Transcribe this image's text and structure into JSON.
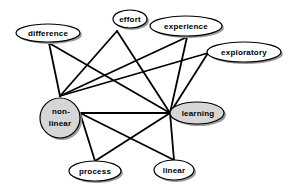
{
  "diagram": {
    "colors": {
      "plain_node_fill": "#ffffff",
      "highlight_node_fill": "#d6d6d6",
      "stroke": "#000000",
      "shadow": "#9a9a9a"
    },
    "nodes": [
      {
        "id": "difference",
        "label": "difference",
        "highlight": false
      },
      {
        "id": "effort",
        "label": "effort",
        "highlight": false
      },
      {
        "id": "experience",
        "label": "experience",
        "highlight": false
      },
      {
        "id": "exploratory",
        "label": "exploratory",
        "highlight": false
      },
      {
        "id": "non-linear",
        "label_line1": "non-",
        "label_line2": "linear",
        "highlight": true
      },
      {
        "id": "learning",
        "label": "learning",
        "highlight": true
      },
      {
        "id": "process",
        "label": "process",
        "highlight": false
      },
      {
        "id": "linear",
        "label": "linear",
        "highlight": false
      }
    ],
    "edges": [
      [
        "difference",
        "non-linear"
      ],
      [
        "difference",
        "learning"
      ],
      [
        "non-linear",
        "effort"
      ],
      [
        "non-linear",
        "experience"
      ],
      [
        "non-linear",
        "exploratory"
      ],
      [
        "non-linear",
        "learning"
      ],
      [
        "non-linear",
        "process"
      ],
      [
        "non-linear",
        "linear"
      ],
      [
        "learning",
        "effort"
      ],
      [
        "learning",
        "experience"
      ],
      [
        "learning",
        "exploratory"
      ],
      [
        "learning",
        "process"
      ],
      [
        "learning",
        "linear"
      ]
    ]
  }
}
